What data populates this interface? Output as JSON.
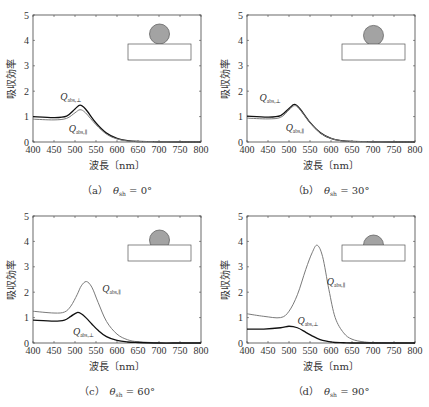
{
  "chart_data": [
    {
      "type": "line",
      "panel": "a",
      "caption": "（a）　θ_sh = 0°",
      "caption_label": "（a）",
      "caption_theta": "θ",
      "caption_sub": "sh",
      "caption_value": " = 0°",
      "xlabel": "波長〔nm〕",
      "ylabel": "吸収効率",
      "xlim": [
        400,
        800
      ],
      "ylim": [
        0,
        5
      ],
      "xticks": [
        400,
        450,
        500,
        550,
        600,
        650,
        700,
        750,
        800
      ],
      "yticks": [
        0,
        1,
        2,
        3,
        4,
        5
      ],
      "grid": false,
      "inset": {
        "shape": "full-sphere-on-substrate",
        "cap_fraction": 1.0
      },
      "x": [
        400,
        450,
        480,
        500,
        512,
        525,
        550,
        575,
        600,
        625,
        650,
        700,
        750,
        800
      ],
      "series": [
        {
          "name": "Q_abs,⊥",
          "label_main": "Q",
          "label_sub": "abs,⊥",
          "color": "#111111",
          "values": [
            1.0,
            0.96,
            1.02,
            1.3,
            1.45,
            1.3,
            0.75,
            0.35,
            0.14,
            0.05,
            0.02,
            0.01,
            0.0,
            0.0
          ],
          "label_pos": [
            465,
            1.65
          ]
        },
        {
          "name": "Q_abs,∥",
          "label_main": "Q",
          "label_sub": "abs,∥",
          "color": "#7a7a7a",
          "values": [
            0.9,
            0.87,
            0.93,
            1.15,
            1.27,
            1.15,
            0.68,
            0.31,
            0.12,
            0.04,
            0.02,
            0.01,
            0.0,
            0.0
          ],
          "label_pos": [
            485,
            0.4
          ]
        }
      ]
    },
    {
      "type": "line",
      "panel": "b",
      "caption": "（b）　θ_sh = 30°",
      "caption_label": "（b）",
      "caption_theta": "θ",
      "caption_sub": "sh",
      "caption_value": " = 30°",
      "xlabel": "波長〔nm〕",
      "ylabel": "吸収効率",
      "xlim": [
        400,
        800
      ],
      "ylim": [
        0,
        5
      ],
      "xticks": [
        400,
        450,
        500,
        550,
        600,
        650,
        700,
        750,
        800
      ],
      "yticks": [
        0,
        1,
        2,
        3,
        4,
        5
      ],
      "grid": false,
      "inset": {
        "shape": "sphere-cap-30",
        "cap_fraction": 0.93
      },
      "x": [
        400,
        450,
        480,
        500,
        513,
        525,
        550,
        575,
        600,
        625,
        650,
        700,
        750,
        800
      ],
      "series": [
        {
          "name": "Q_abs,⊥",
          "label_main": "Q",
          "label_sub": "abs,⊥",
          "color": "#111111",
          "values": [
            1.02,
            0.98,
            1.04,
            1.32,
            1.48,
            1.33,
            0.77,
            0.36,
            0.14,
            0.05,
            0.02,
            0.01,
            0.0,
            0.0
          ],
          "label_pos": [
            430,
            1.6
          ]
        },
        {
          "name": "Q_abs,∥",
          "label_main": "Q",
          "label_sub": "abs,∥",
          "color": "#7a7a7a",
          "values": [
            0.94,
            0.91,
            0.97,
            1.26,
            1.43,
            1.3,
            0.76,
            0.35,
            0.14,
            0.05,
            0.02,
            0.01,
            0.0,
            0.0
          ],
          "label_pos": [
            492,
            0.45
          ]
        }
      ]
    },
    {
      "type": "line",
      "panel": "c",
      "caption": "（c）　θ_sh = 60°",
      "caption_label": "（c）",
      "caption_theta": "θ",
      "caption_sub": "sh",
      "caption_value": " = 60°",
      "xlabel": "波長〔nm〕",
      "ylabel": "吸収効率",
      "xlim": [
        400,
        800
      ],
      "ylim": [
        0,
        5
      ],
      "xticks": [
        400,
        450,
        500,
        550,
        600,
        650,
        700,
        750,
        800
      ],
      "yticks": [
        0,
        1,
        2,
        3,
        4,
        5
      ],
      "grid": false,
      "inset": {
        "shape": "sphere-cap-60",
        "cap_fraction": 0.75
      },
      "x": [
        400,
        450,
        475,
        490,
        505,
        515,
        527,
        540,
        555,
        575,
        600,
        625,
        650,
        700,
        750,
        800
      ],
      "series": [
        {
          "name": "Q_abs,∥",
          "label_main": "Q",
          "label_sub": "abs,∥",
          "color": "#7a7a7a",
          "values": [
            1.25,
            1.18,
            1.22,
            1.45,
            1.9,
            2.25,
            2.42,
            2.2,
            1.6,
            0.85,
            0.35,
            0.13,
            0.05,
            0.01,
            0.0,
            0.0
          ],
          "label_pos": [
            565,
            2.0
          ]
        },
        {
          "name": "Q_abs,⊥",
          "label_main": "Q",
          "label_sub": "abs,⊥",
          "color": "#111111",
          "values": [
            0.9,
            0.86,
            0.9,
            1.05,
            1.2,
            1.15,
            0.98,
            0.75,
            0.5,
            0.25,
            0.1,
            0.04,
            0.02,
            0.0,
            0.0,
            0.0
          ],
          "label_pos": [
            495,
            0.3
          ]
        }
      ]
    },
    {
      "type": "line",
      "panel": "d",
      "caption": "（d）　θ_sh = 90°",
      "caption_label": "（d）",
      "caption_theta": "θ",
      "caption_sub": "sh",
      "caption_value": " = 90°",
      "xlabel": "波長〔nm〕",
      "ylabel": "吸収効率",
      "xlim": [
        400,
        800
      ],
      "ylim": [
        0,
        5
      ],
      "xticks": [
        400,
        450,
        500,
        550,
        600,
        650,
        700,
        750,
        800
      ],
      "yticks": [
        0,
        1,
        2,
        3,
        4,
        5
      ],
      "grid": false,
      "inset": {
        "shape": "hemisphere",
        "cap_fraction": 0.5
      },
      "x": [
        400,
        440,
        480,
        500,
        520,
        540,
        555,
        567,
        580,
        595,
        610,
        630,
        650,
        680,
        720,
        800
      ],
      "series": [
        {
          "name": "Q_abs,∥",
          "label_main": "Q",
          "label_sub": "abs,∥",
          "color": "#7a7a7a",
          "values": [
            1.15,
            1.05,
            1.0,
            1.25,
            1.9,
            2.9,
            3.55,
            3.85,
            3.4,
            2.1,
            1.0,
            0.4,
            0.15,
            0.04,
            0.01,
            0.0
          ],
          "label_pos": [
            590,
            2.3
          ]
        },
        {
          "name": "Q_abs,⊥",
          "label_main": "Q",
          "label_sub": "abs,⊥",
          "color": "#111111",
          "values": [
            0.55,
            0.55,
            0.6,
            0.66,
            0.6,
            0.42,
            0.28,
            0.18,
            0.1,
            0.05,
            0.02,
            0.01,
            0.0,
            0.0,
            0.0,
            0.0
          ],
          "label_pos": [
            520,
            0.75
          ]
        }
      ]
    }
  ]
}
